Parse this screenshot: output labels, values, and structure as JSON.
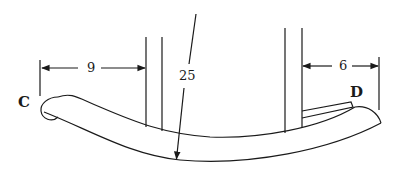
{
  "diagram": {
    "stroke_color": "#1a1a1a",
    "background": "#ffffff",
    "points": [
      {
        "id": "C",
        "label": "C"
      },
      {
        "id": "D",
        "label": "D"
      }
    ],
    "dimensions": [
      {
        "id": "left-offset",
        "label": "9",
        "description": "distance from left end (C) to front leg"
      },
      {
        "id": "radius",
        "label": "25",
        "description": "radius of rocker curve"
      },
      {
        "id": "right-offset",
        "label": "6",
        "description": "distance from rear leg to right end (D)"
      }
    ]
  }
}
